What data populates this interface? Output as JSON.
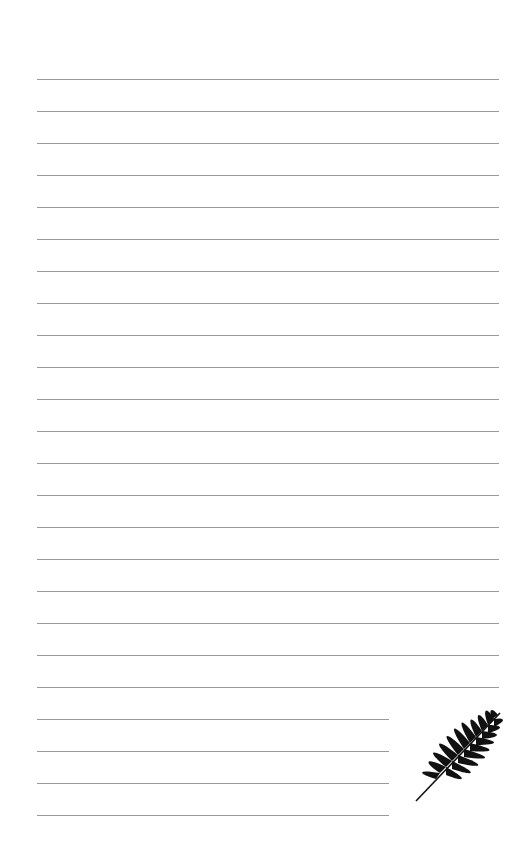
{
  "page": {
    "type": "lined-notebook-page",
    "line_color": "#9a9a9a",
    "background": "#ffffff",
    "full_lines": 20,
    "short_lines": 4,
    "first_line_y": 79,
    "line_spacing": 32
  },
  "decoration": {
    "icon": "palm-leaf-icon",
    "color": "#111111"
  }
}
